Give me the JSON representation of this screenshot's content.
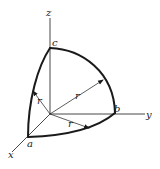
{
  "figure": {
    "axes": {
      "x": "x",
      "y": "y",
      "z": "z"
    },
    "points": {
      "a": "a",
      "b": "b",
      "c": "c"
    },
    "radius_labels": [
      "r",
      "r",
      "r"
    ],
    "colors": {
      "ink": "#1a1a1a",
      "background": "#ffffff"
    }
  }
}
